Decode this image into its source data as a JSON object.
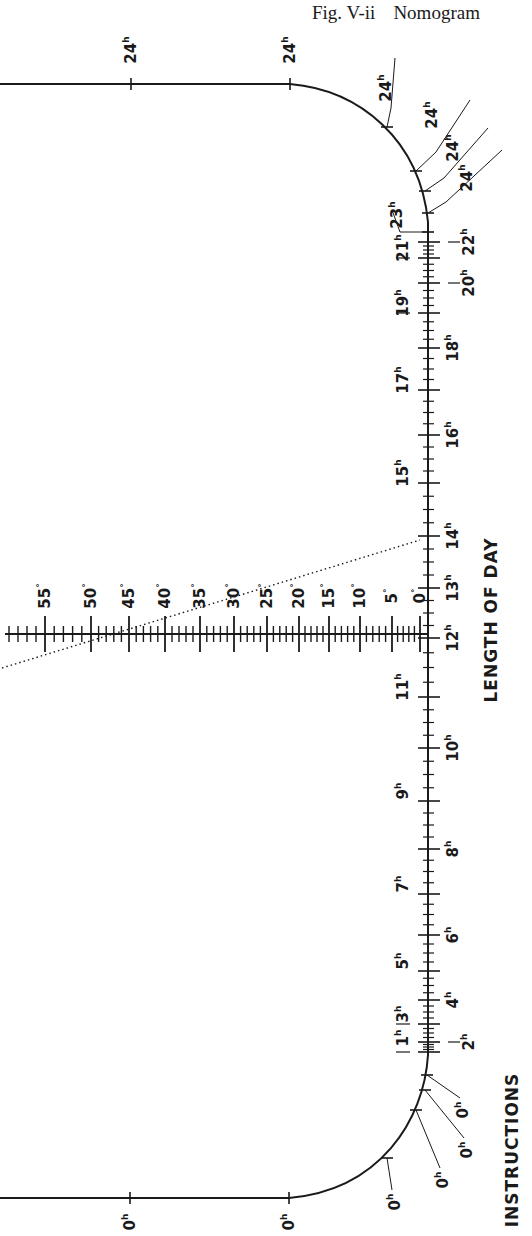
{
  "figure": {
    "number": "Fig. V-ii",
    "title": "Nomogram"
  },
  "labels": {
    "length_of_day": "LENGTH OF DAY",
    "instructions": "INSTRUCTIONS"
  },
  "day_scale": {
    "unit_suffix": "h",
    "top_line": [
      {
        "label": "24",
        "x": 131
      },
      {
        "label": "24",
        "x": 290
      }
    ],
    "top_curve": [
      {
        "label": "24",
        "x": 387,
        "y": 127
      },
      {
        "label": "24",
        "x": 416,
        "y": 171
      },
      {
        "label": "24",
        "x": 425,
        "y": 191
      },
      {
        "label": "24",
        "x": 428,
        "y": 213
      },
      {
        "label": "23",
        "x": 428,
        "y": 232
      }
    ],
    "axis_ticks": [
      {
        "label": "22",
        "y": 242,
        "side": "right"
      },
      {
        "label": "21",
        "y": 258,
        "side": "left"
      },
      {
        "label": "20",
        "y": 283,
        "side": "right"
      },
      {
        "label": "19",
        "y": 313,
        "side": "left"
      },
      {
        "label": "18",
        "y": 348,
        "side": "right"
      },
      {
        "label": "17",
        "y": 390,
        "side": "left"
      },
      {
        "label": "16",
        "y": 435,
        "side": "right"
      },
      {
        "label": "15",
        "y": 483,
        "side": "left"
      },
      {
        "label": "14",
        "y": 536,
        "side": "right"
      },
      {
        "label": "13",
        "y": 588,
        "side": "right"
      },
      {
        "label": "12",
        "y": 638,
        "side": "right"
      },
      {
        "label": "11",
        "y": 697,
        "side": "left"
      },
      {
        "label": "10",
        "y": 748,
        "side": "right"
      },
      {
        "label": "9",
        "y": 801,
        "side": "left"
      },
      {
        "label": "8",
        "y": 849,
        "side": "right"
      },
      {
        "label": "7",
        "y": 894,
        "side": "left"
      },
      {
        "label": "6",
        "y": 935,
        "side": "right"
      },
      {
        "label": "5",
        "y": 971,
        "side": "left"
      },
      {
        "label": "4",
        "y": 1000,
        "side": "right"
      },
      {
        "label": "3",
        "y": 1024,
        "side": "left"
      },
      {
        "label": "2",
        "y": 1042,
        "side": "right"
      },
      {
        "label": "1",
        "y": 1052,
        "side": "left"
      }
    ],
    "bottom_curve": [
      {
        "label": "0",
        "x": 427,
        "y": 1075
      },
      {
        "label": "0",
        "x": 425,
        "y": 1090
      },
      {
        "label": "0",
        "x": 416,
        "y": 1110
      },
      {
        "label": "0",
        "x": 387,
        "y": 1158
      }
    ],
    "bottom_line": [
      {
        "label": "0",
        "x": 130
      },
      {
        "label": "0",
        "x": 289
      }
    ]
  },
  "latitude_scale": {
    "unit_suffix": "°",
    "y": 634,
    "ticks": [
      {
        "label": "55",
        "x": 45
      },
      {
        "label": "50",
        "x": 91
      },
      {
        "label": "45",
        "x": 129
      },
      {
        "label": "40",
        "x": 165
      },
      {
        "label": "35",
        "x": 200
      },
      {
        "label": "30",
        "x": 234
      },
      {
        "label": "25",
        "x": 267
      },
      {
        "label": "20",
        "x": 299
      },
      {
        "label": "15",
        "x": 329
      },
      {
        "label": "10",
        "x": 360
      },
      {
        "label": "5",
        "x": 392
      },
      {
        "label": "0",
        "x": 420
      }
    ]
  },
  "example_line": {
    "style": "dotted",
    "from": [
      2,
      668
    ],
    "to": [
      420,
      540
    ]
  }
}
